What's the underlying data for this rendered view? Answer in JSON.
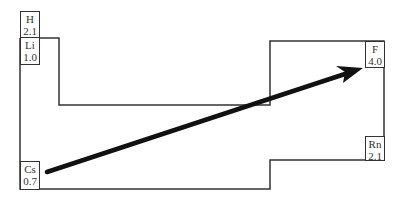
{
  "diagram": {
    "elements": [
      {
        "symbol": "H",
        "value": "2.1"
      },
      {
        "symbol": "Li",
        "value": "1.0"
      },
      {
        "symbol": "F",
        "value": "4.0"
      },
      {
        "symbol": "Rn",
        "value": "2.1"
      },
      {
        "symbol": "Cs",
        "value": "0.7"
      }
    ],
    "arrow": {
      "from": "Cs",
      "to": "F",
      "meaning": "increasing electronegativity"
    },
    "colors": {
      "outline": "#333333",
      "arrow": "#111111",
      "background": "#ffffff"
    }
  }
}
